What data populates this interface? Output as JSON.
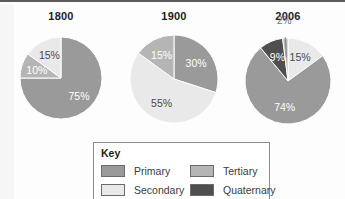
{
  "colors": {
    "primary": "#9a9a9a",
    "secondary": "#e9e9e9",
    "tertiary": "#b5b5b5",
    "quaternary": "#4f4f4f",
    "slice_stroke": "#ffffff",
    "text": "#1d1d1d",
    "box_border": "#8a8a8a",
    "background": "#fdfdfd"
  },
  "key": {
    "title": "Key",
    "items": [
      {
        "label": "Primary",
        "color_name": "primary"
      },
      {
        "label": "Secondary",
        "color_name": "secondary"
      },
      {
        "label": "Tertiary",
        "color_name": "tertiary"
      },
      {
        "label": "Quaternary",
        "color_name": "quaternary"
      }
    ]
  },
  "chart_data": [
    {
      "type": "pie",
      "title": "1800",
      "labels": [
        "Primary",
        "Tertiary",
        "Secondary"
      ],
      "values": [
        75,
        10,
        15
      ],
      "value_labels": [
        "75%",
        "10%",
        "15%"
      ],
      "legend_position": "bottom-shared",
      "slice_colors": [
        "primary",
        "tertiary",
        "secondary"
      ]
    },
    {
      "type": "pie",
      "title": "1900",
      "labels": [
        "Primary",
        "Secondary",
        "Tertiary"
      ],
      "values": [
        30,
        55,
        15
      ],
      "value_labels": [
        "30%",
        "55%",
        "15%"
      ],
      "legend_position": "bottom-shared",
      "slice_colors": [
        "primary",
        "secondary",
        "tertiary"
      ]
    },
    {
      "type": "pie",
      "title": "2006",
      "labels": [
        "Secondary",
        "Primary",
        "Quaternary",
        "Tertiary"
      ],
      "values": [
        15,
        74,
        9,
        2
      ],
      "value_labels": [
        "15%",
        "74%",
        "9%",
        "2%"
      ],
      "legend_position": "bottom-shared",
      "slice_colors": [
        "secondary",
        "primary",
        "quaternary",
        "tertiary"
      ]
    }
  ]
}
